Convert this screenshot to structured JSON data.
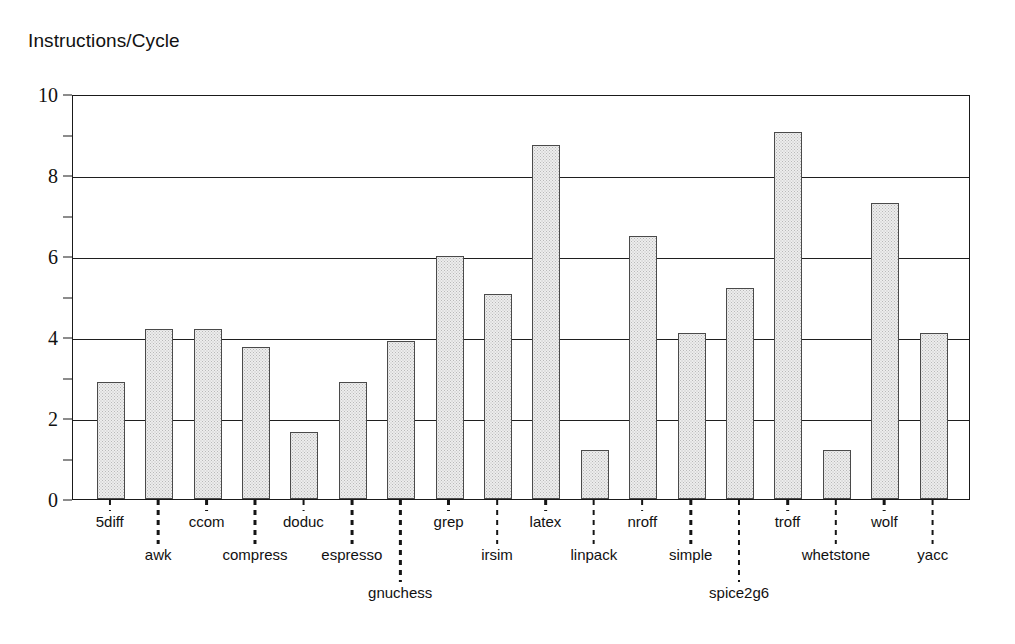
{
  "chart_data": {
    "type": "bar",
    "title": "Instructions/Cycle",
    "xlabel": "",
    "ylabel": "Instructions/Cycle",
    "ylim": [
      0,
      10
    ],
    "grid": true,
    "legend": null,
    "y_major_ticks": [
      0,
      2,
      4,
      6,
      8,
      10
    ],
    "y_minor_ticks": [
      1,
      3,
      5,
      7,
      9
    ],
    "y_tick_labels": [
      "0",
      "2",
      "4",
      "6",
      "8",
      "10"
    ],
    "categories": [
      "5diff",
      "awk",
      "ccom",
      "compress",
      "doduc",
      "espresso",
      "gnuchess",
      "grep",
      "irsim",
      "latex",
      "linpack",
      "nroff",
      "simple",
      "spice2g6",
      "troff",
      "whetstone",
      "wolf",
      "yacc"
    ],
    "values": [
      2.9,
      4.2,
      4.2,
      3.75,
      1.65,
      2.9,
      3.9,
      6.0,
      5.07,
      8.75,
      1.2,
      6.5,
      4.1,
      5.2,
      9.05,
      1.2,
      7.3,
      4.1
    ],
    "bar_style": {
      "fill": "#ededed",
      "pattern": "fine-gray-stipple",
      "border": "#4a4a4a"
    },
    "label_tiers": [
      0,
      1,
      0,
      1,
      0,
      1,
      2,
      0,
      1,
      0,
      1,
      0,
      1,
      2,
      0,
      1,
      0,
      1
    ]
  },
  "axis": {
    "frame_color": "#1a1a1a",
    "gridline_color": "#1f1f1f"
  }
}
